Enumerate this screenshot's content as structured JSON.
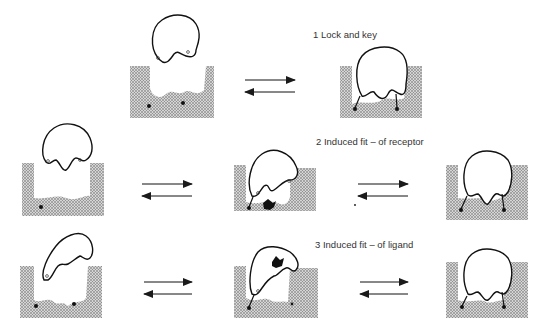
{
  "figure": {
    "type": "receptor-ligand binding models",
    "colors": {
      "ink": "#1a1a1a",
      "stipple": "#9a9a9a",
      "background": "#ffffff"
    },
    "panels": [
      {
        "id": 1,
        "label": "1  Lock and key",
        "states": [
          "unbound",
          "bound"
        ],
        "arrow": "reversible"
      },
      {
        "id": 2,
        "label": "2  Induced fit – of receptor",
        "states": [
          "unbound",
          "intermediate",
          "bound"
        ],
        "arrows": [
          "reversible",
          "reversible"
        ]
      },
      {
        "id": 3,
        "label": "3  Induced fit – of ligand",
        "states": [
          "unbound",
          "intermediate",
          "bound"
        ],
        "arrows": [
          "reversible",
          "reversible"
        ]
      }
    ]
  }
}
